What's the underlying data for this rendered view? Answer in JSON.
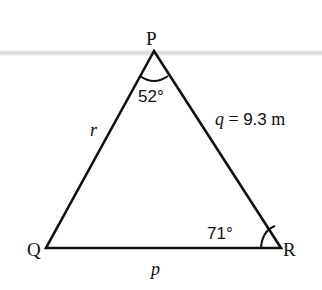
{
  "diagram": {
    "type": "triangle",
    "vertices": [
      {
        "id": "P",
        "label": "P",
        "x": 154,
        "y": 51
      },
      {
        "id": "Q",
        "label": "Q",
        "x": 46,
        "y": 248
      },
      {
        "id": "R",
        "label": "R",
        "x": 281,
        "y": 248
      }
    ],
    "sides": {
      "r": {
        "label": "r",
        "between": [
          "P",
          "Q"
        ]
      },
      "q": {
        "label": "q",
        "equals": "=",
        "value": "9.3",
        "unit": "m",
        "between": [
          "P",
          "R"
        ]
      },
      "p": {
        "label": "p",
        "between": [
          "Q",
          "R"
        ]
      }
    },
    "angles": {
      "P": {
        "value": "52°",
        "at": "P"
      },
      "R": {
        "value": "71°",
        "at": "R"
      }
    },
    "colors": {
      "stroke": "#111111",
      "background": "#ffffff",
      "band": "#c8c8c8"
    }
  }
}
